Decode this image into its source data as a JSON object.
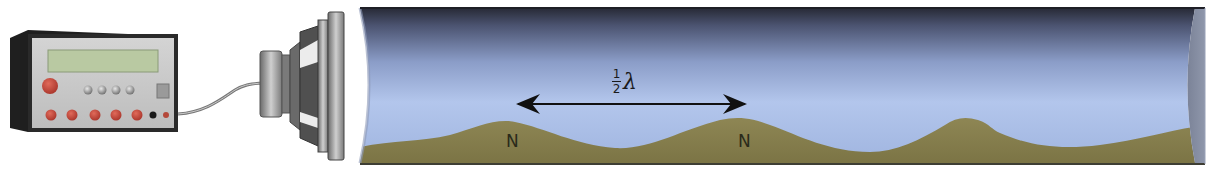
{
  "diagram": {
    "components": {
      "signal_generator": {
        "name": "signal generator",
        "display": ""
      },
      "speaker": {
        "name": "loudspeaker"
      },
      "tube": {
        "name": "glass tube with powder"
      }
    },
    "annotation": {
      "distance_label_numerator": "1",
      "distance_label_denominator": "2",
      "distance_label_symbol": "λ",
      "distance_meaning": "half wavelength between adjacent nodes"
    },
    "nodes": [
      {
        "label": "N",
        "x": 513
      },
      {
        "label": "N",
        "x": 745
      }
    ],
    "colors": {
      "tube_top": "#2b2d3a",
      "tube_mid": "#a9bde6",
      "tube_bottom": "#8fa6d6",
      "powder": "#8c8350",
      "powder_dark": "#6f6a3e",
      "generator_body": "#2b2b2b",
      "generator_panel": "#c8c8c8",
      "display": "#b9c9a2",
      "knob": "#c8473a",
      "speaker_metal": "#8a8a8a"
    }
  }
}
